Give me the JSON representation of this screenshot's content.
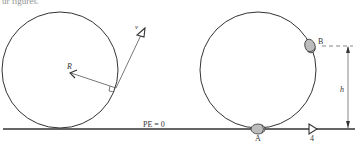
{
  "header": {
    "partial_text": "ur figures."
  },
  "left_figure": {
    "radius_label": "R",
    "velocity_label": "v",
    "ground_label": "PE = 0"
  },
  "right_figure": {
    "point_a_label": "A",
    "point_b_label": "B",
    "height_label": "h",
    "direction_label": "4"
  },
  "colors": {
    "stroke": "#333333",
    "bead_fill": "#bdbdbd",
    "background": "#ffffff"
  }
}
